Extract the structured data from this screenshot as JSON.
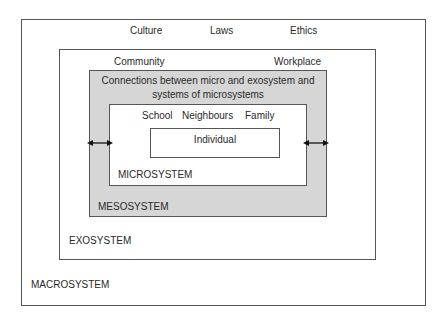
{
  "diagram": {
    "type": "nested-systems",
    "macrosystem": {
      "label": "MACROSYSTEM",
      "items": [
        "Culture",
        "Laws",
        "Ethics"
      ]
    },
    "exosystem": {
      "label": "EXOSYSTEM",
      "items": [
        "Community",
        "Workplace"
      ]
    },
    "mesosystem": {
      "label": "MESOSYSTEM",
      "description_line1": "Connections between micro and exosystem and",
      "description_line2": "systems of microsystems",
      "fill_color": "#d6d6d6"
    },
    "microsystem": {
      "label": "MICROSYSTEM",
      "items": [
        "School",
        "Neighbours",
        "Family"
      ]
    },
    "individual": {
      "label": "Individual"
    },
    "connectors": [
      {
        "type": "double-arrow",
        "position": "left",
        "between": [
          "exosystem",
          "microsystem"
        ]
      },
      {
        "type": "double-arrow",
        "position": "right",
        "between": [
          "microsystem",
          "exosystem"
        ]
      }
    ]
  }
}
